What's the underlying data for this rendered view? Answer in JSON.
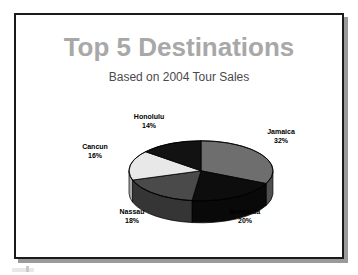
{
  "slide": {
    "title": "Top 5 Destinations",
    "subtitle": "Based on 2004 Tour Sales",
    "title_color": "#a8a8a8",
    "subtitle_color": "#4a4a4a",
    "border_color": "#1a1a1a",
    "background": "#ffffff"
  },
  "labels": {
    "honolulu_name": "Honolulu",
    "honolulu_pct": "14%",
    "jamaica_name": "Jamaica",
    "jamaica_pct": "32%",
    "bermuda_name": "Bermuda",
    "bermuda_pct": "20%",
    "nassau_name": "Nassau",
    "nassau_pct": "18%",
    "cancun_name": "Cancun",
    "cancun_pct": "16%"
  },
  "chart_data": {
    "type": "pie",
    "title": "Top 5 Destinations",
    "subtitle": "Based on 2004 Tour Sales",
    "xlabel": "",
    "ylabel": "",
    "three_d": true,
    "legend_position": "none",
    "labels_outside": true,
    "start_angle_deg": 0,
    "direction": "clockwise",
    "categories": [
      "Jamaica",
      "Bermuda",
      "Nassau",
      "Cancun",
      "Honolulu"
    ],
    "values": [
      32,
      20,
      18,
      16,
      14
    ],
    "unit": "percent",
    "total": 100,
    "slice_colors": [
      "#6e6e6e",
      "#0d0d0d",
      "#4a4a4a",
      "#e8e8e8",
      "#121212"
    ],
    "series": [
      {
        "name": "2004 Tour Sales",
        "values": [
          32,
          20,
          18,
          16,
          14
        ]
      }
    ],
    "points": [
      {
        "label": "Jamaica",
        "value": 32,
        "display": "32%",
        "color": "#6e6e6e"
      },
      {
        "label": "Bermuda",
        "value": 20,
        "display": "20%",
        "color": "#0d0d0d"
      },
      {
        "label": "Nassau",
        "value": 18,
        "display": "18%",
        "color": "#4a4a4a"
      },
      {
        "label": "Cancun",
        "value": 16,
        "display": "16%",
        "color": "#e8e8e8"
      },
      {
        "label": "Honolulu",
        "value": 14,
        "display": "14%",
        "color": "#121212"
      }
    ]
  }
}
